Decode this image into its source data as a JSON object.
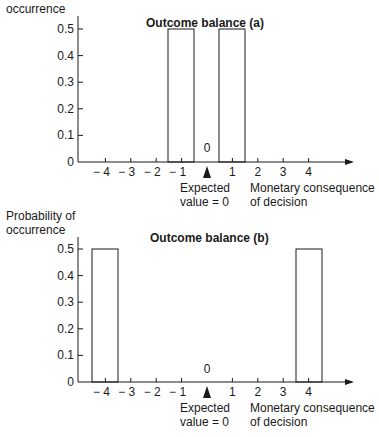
{
  "chart_data": [
    {
      "type": "bar",
      "title": "Outcome balance (a)",
      "ylabel": "Probability of occurrence",
      "xlabel": "Monetary consequence of decision",
      "x": [
        -1,
        1
      ],
      "values": [
        0.5,
        0.5
      ],
      "bar_width": 1,
      "xticks": [
        "-4",
        "-3",
        "-2",
        "-1",
        "1",
        "2",
        "3",
        "4"
      ],
      "yticks": [
        "0",
        "0.1",
        "0.2",
        "0.3",
        "0.4",
        "0.5"
      ],
      "ylim": [
        0,
        0.5
      ],
      "xlim": [
        -5,
        5.5
      ],
      "annotation": {
        "x": 0,
        "marker": "triangle",
        "label_top": "0",
        "label_bottom": "Expected value = 0"
      },
      "grid": false
    },
    {
      "type": "bar",
      "title": "Outcome balance (b)",
      "ylabel": "Probability of occurrence",
      "xlabel": "Monetary consequence of decision",
      "x": [
        -4,
        4
      ],
      "values": [
        0.5,
        0.5
      ],
      "bar_width": 1,
      "xticks": [
        "-4",
        "-3",
        "-2",
        "-1",
        "1",
        "2",
        "3",
        "4"
      ],
      "yticks": [
        "0",
        "0.1",
        "0.2",
        "0.3",
        "0.4",
        "0.5"
      ],
      "ylim": [
        0,
        0.5
      ],
      "xlim": [
        -5,
        5.5
      ],
      "annotation": {
        "x": 0,
        "marker": "triangle",
        "label_top": "0",
        "label_bottom": "Expected value = 0"
      },
      "grid": false
    }
  ],
  "charts": {
    "a": {
      "ylabel_visible": "occurrence",
      "title": "Outcome balance (a)",
      "zero_label": "0",
      "expected_label": "Expected\nvalue  =  0",
      "xlabel": "Monetary consequence\nof decision"
    },
    "b": {
      "ylabel_visible": "Probability of\noccurrence",
      "title": "Outcome balance (b)",
      "zero_label": "0",
      "expected_label": "Expected\nvalue  =  0",
      "xlabel": "Monetary consequence\nof decision"
    }
  },
  "axis": {
    "yticks": [
      "0",
      "0.1",
      "0.2",
      "0.3",
      "0.4",
      "0.5"
    ],
    "xticks": [
      "− 4",
      "− 3",
      "− 2",
      "− 1",
      "1",
      "2",
      "3",
      "4"
    ]
  }
}
